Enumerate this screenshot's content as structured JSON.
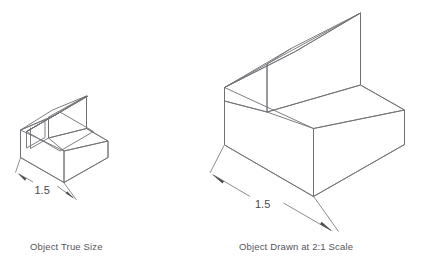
{
  "figure": {
    "background_color": "#ffffff",
    "line_color": "#6f6f74",
    "text_color": "#4a4a4a",
    "type": "isometric-technical-drawing"
  },
  "objects": [
    {
      "id": "true-size-object",
      "caption": "Object True Size",
      "scale": "1:1",
      "dimension": {
        "value": "1.5",
        "label": "1.5",
        "placement": "front-left-bottom-edge"
      }
    },
    {
      "id": "scaled-object",
      "caption": "Object Drawn at 2:1 Scale",
      "scale": "2:1",
      "dimension": {
        "value": "1.5",
        "label": "1.5",
        "placement": "front-left-bottom-edge"
      }
    }
  ],
  "captions": {
    "left": "Object True Size",
    "right": "Object Drawn at 2:1 Scale"
  },
  "dimensions": {
    "left_value": "1.5",
    "right_value": "1.5"
  }
}
